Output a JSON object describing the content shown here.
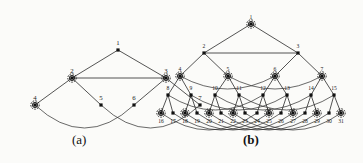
{
  "figure": {
    "caption_a": "(a)",
    "caption_b": "(b)",
    "background_color": "#fbfbf9",
    "edge_color": "#2a2a2a",
    "node_color": "#111111"
  },
  "chart_data": {
    "type": "diagram",
    "title": "",
    "subtitle": "",
    "panels": [
      {
        "id": "a",
        "caption": "(a)",
        "node_count": 7,
        "levels": [
          [
            1
          ],
          [
            2,
            3
          ],
          [
            4,
            5,
            6,
            7
          ]
        ],
        "nodes": [
          {
            "id": 1,
            "label": "1",
            "x": 118,
            "y": 50,
            "level": 0,
            "marked": false,
            "label_pos": "above"
          },
          {
            "id": 2,
            "label": "2",
            "x": 72,
            "y": 78,
            "level": 1,
            "marked": true,
            "label_pos": "above"
          },
          {
            "id": 3,
            "label": "3",
            "x": 166,
            "y": 78,
            "level": 1,
            "marked": true,
            "label_pos": "above"
          },
          {
            "id": 4,
            "label": "4",
            "x": 35,
            "y": 105,
            "level": 2,
            "marked": true,
            "label_pos": "above"
          },
          {
            "id": 5,
            "label": "5",
            "x": 101,
            "y": 105,
            "level": 2,
            "marked": false,
            "label_pos": "above"
          },
          {
            "id": 6,
            "label": "6",
            "x": 134,
            "y": 105,
            "level": 2,
            "marked": false,
            "label_pos": "above"
          },
          {
            "id": 7,
            "label": "7",
            "x": 200,
            "y": 105,
            "level": 2,
            "marked": false,
            "label_pos": "above"
          }
        ],
        "tree_edges": [
          [
            1,
            2
          ],
          [
            1,
            3
          ],
          [
            2,
            4
          ],
          [
            2,
            5
          ],
          [
            3,
            6
          ],
          [
            3,
            7
          ]
        ],
        "cross_edges": [
          [
            2,
            3
          ]
        ],
        "curved_edges": [
          [
            4,
            6
          ],
          [
            5,
            7
          ]
        ]
      },
      {
        "id": "b",
        "caption": "(b)",
        "node_count": 31,
        "levels": [
          [
            1
          ],
          [
            2,
            3
          ],
          [
            4,
            5,
            6,
            7
          ],
          [
            8,
            9,
            10,
            11,
            12,
            13,
            14,
            15
          ],
          [
            16,
            17,
            18,
            19,
            20,
            21,
            22,
            23,
            24,
            25,
            26,
            27,
            28,
            29,
            30,
            31
          ]
        ],
        "nodes": [
          {
            "id": 1,
            "label": "1",
            "x": 251,
            "y": 24,
            "level": 0,
            "marked": true,
            "label_pos": "above"
          },
          {
            "id": 2,
            "label": "2",
            "x": 204,
            "y": 53,
            "level": 1,
            "marked": false,
            "label_pos": "above"
          },
          {
            "id": 3,
            "label": "3",
            "x": 298,
            "y": 53,
            "level": 1,
            "marked": false,
            "label_pos": "above"
          },
          {
            "id": 4,
            "label": "4",
            "x": 180,
            "y": 76,
            "level": 2,
            "marked": true,
            "label_pos": "above"
          },
          {
            "id": 5,
            "label": "5",
            "x": 228,
            "y": 76,
            "level": 2,
            "marked": true,
            "label_pos": "above"
          },
          {
            "id": 6,
            "label": "6",
            "x": 275,
            "y": 76,
            "level": 2,
            "marked": true,
            "label_pos": "above"
          },
          {
            "id": 7,
            "label": "7",
            "x": 322,
            "y": 76,
            "level": 2,
            "marked": true,
            "label_pos": "above"
          },
          {
            "id": 8,
            "label": "8",
            "x": 168,
            "y": 95,
            "level": 3,
            "marked": false,
            "label_pos": "above"
          },
          {
            "id": 9,
            "label": "9",
            "x": 191,
            "y": 95,
            "level": 3,
            "marked": false,
            "label_pos": "above"
          },
          {
            "id": 10,
            "label": "10",
            "x": 215,
            "y": 95,
            "level": 3,
            "marked": false,
            "label_pos": "above"
          },
          {
            "id": 11,
            "label": "11",
            "x": 239,
            "y": 95,
            "level": 3,
            "marked": false,
            "label_pos": "above"
          },
          {
            "id": 12,
            "label": "12",
            "x": 263,
            "y": 95,
            "level": 3,
            "marked": false,
            "label_pos": "above"
          },
          {
            "id": 13,
            "label": "13",
            "x": 287,
            "y": 95,
            "level": 3,
            "marked": false,
            "label_pos": "above"
          },
          {
            "id": 14,
            "label": "14",
            "x": 311,
            "y": 95,
            "level": 3,
            "marked": false,
            "label_pos": "above"
          },
          {
            "id": 15,
            "label": "15",
            "x": 334,
            "y": 95,
            "level": 3,
            "marked": false,
            "label_pos": "above"
          },
          {
            "id": 16,
            "label": "16",
            "x": 161,
            "y": 113,
            "level": 4,
            "marked": true,
            "label_pos": "below"
          },
          {
            "id": 17,
            "label": "17",
            "x": 173,
            "y": 113,
            "level": 4,
            "marked": false,
            "label_pos": "below"
          },
          {
            "id": 18,
            "label": "18",
            "x": 185,
            "y": 113,
            "level": 4,
            "marked": true,
            "label_pos": "below"
          },
          {
            "id": 19,
            "label": "19",
            "x": 197,
            "y": 113,
            "level": 4,
            "marked": false,
            "label_pos": "below"
          },
          {
            "id": 20,
            "label": "20",
            "x": 209,
            "y": 113,
            "level": 4,
            "marked": true,
            "label_pos": "below"
          },
          {
            "id": 21,
            "label": "21",
            "x": 221,
            "y": 113,
            "level": 4,
            "marked": false,
            "label_pos": "below"
          },
          {
            "id": 22,
            "label": "22",
            "x": 233,
            "y": 113,
            "level": 4,
            "marked": true,
            "label_pos": "below"
          },
          {
            "id": 23,
            "label": "23",
            "x": 245,
            "y": 113,
            "level": 4,
            "marked": false,
            "label_pos": "below"
          },
          {
            "id": 24,
            "label": "24",
            "x": 257,
            "y": 113,
            "level": 4,
            "marked": false,
            "label_pos": "below"
          },
          {
            "id": 25,
            "label": "25",
            "x": 269,
            "y": 113,
            "level": 4,
            "marked": true,
            "label_pos": "below"
          },
          {
            "id": 26,
            "label": "26",
            "x": 281,
            "y": 113,
            "level": 4,
            "marked": false,
            "label_pos": "below"
          },
          {
            "id": 27,
            "label": "27",
            "x": 293,
            "y": 113,
            "level": 4,
            "marked": true,
            "label_pos": "below"
          },
          {
            "id": 28,
            "label": "28",
            "x": 305,
            "y": 113,
            "level": 4,
            "marked": false,
            "label_pos": "below"
          },
          {
            "id": 29,
            "label": "29",
            "x": 317,
            "y": 113,
            "level": 4,
            "marked": true,
            "label_pos": "below"
          },
          {
            "id": 30,
            "label": "30",
            "x": 329,
            "y": 113,
            "level": 4,
            "marked": false,
            "label_pos": "below"
          },
          {
            "id": 31,
            "label": "31",
            "x": 341,
            "y": 113,
            "level": 4,
            "marked": true,
            "label_pos": "below"
          }
        ],
        "tree_edges": [
          [
            1,
            2
          ],
          [
            1,
            3
          ],
          [
            2,
            4
          ],
          [
            2,
            5
          ],
          [
            3,
            6
          ],
          [
            3,
            7
          ],
          [
            4,
            8
          ],
          [
            4,
            9
          ],
          [
            5,
            10
          ],
          [
            5,
            11
          ],
          [
            6,
            12
          ],
          [
            6,
            13
          ],
          [
            7,
            14
          ],
          [
            7,
            15
          ],
          [
            8,
            16
          ],
          [
            8,
            17
          ],
          [
            9,
            18
          ],
          [
            9,
            19
          ],
          [
            10,
            20
          ],
          [
            10,
            21
          ],
          [
            11,
            22
          ],
          [
            11,
            23
          ],
          [
            12,
            24
          ],
          [
            12,
            25
          ],
          [
            13,
            26
          ],
          [
            13,
            27
          ],
          [
            14,
            28
          ],
          [
            14,
            29
          ],
          [
            15,
            30
          ],
          [
            15,
            31
          ]
        ],
        "cross_edges": [
          [
            2,
            3
          ]
        ],
        "curved_edges_level2": [
          [
            4,
            6
          ],
          [
            5,
            7
          ]
        ],
        "curved_edges_level3": [
          [
            8,
            12
          ],
          [
            9,
            13
          ],
          [
            10,
            14
          ],
          [
            11,
            15
          ]
        ],
        "curved_edges_level4": [
          [
            16,
            24
          ],
          [
            17,
            25
          ],
          [
            18,
            26
          ],
          [
            19,
            27
          ],
          [
            20,
            28
          ],
          [
            21,
            29
          ],
          [
            22,
            30
          ],
          [
            23,
            31
          ]
        ]
      }
    ]
  }
}
